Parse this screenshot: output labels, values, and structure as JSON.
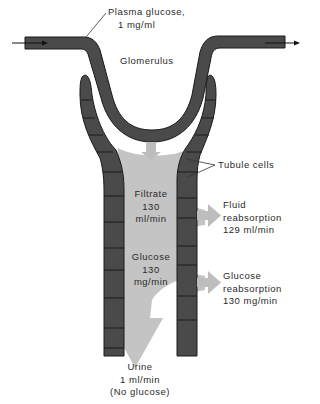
{
  "labels": {
    "plasma": [
      "Plasma glucose,",
      "1 mg/ml"
    ],
    "glomerulus": "Glomerulus",
    "tubule_cells": "Tubule cells",
    "filtrate": [
      "Filtrate",
      "130",
      "ml/min"
    ],
    "glucose": [
      "Glucose",
      "130",
      "mg/min"
    ],
    "fluid_reabsorption": [
      "Fluid",
      "reabsorption",
      "129 ml/min"
    ],
    "glucose_reabsorption": [
      "Glucose",
      "reabsorption",
      "130 mg/min"
    ],
    "urine": [
      "Urine",
      "1 ml/min",
      "(No glucose)"
    ]
  },
  "colors": {
    "tube": "#4a4a4a",
    "tube_outline": "#1a1a1a",
    "fluid": "#c4c4c4",
    "text": "#2a2a2a",
    "background": "#ffffff"
  },
  "icons": {
    "flow_in": "arrow-right-icon",
    "flow_out": "arrow-right-icon",
    "filtration_arrow": "arrow-down-icon",
    "urine_arrow": "arrow-down-icon",
    "reabsorption_arrows": "arrow-right-icon"
  }
}
